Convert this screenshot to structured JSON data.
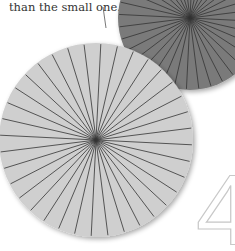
{
  "caption": "than the small one.",
  "page_number": "4",
  "colors": {
    "large_circle_fill": "#cfcfcf",
    "small_circle_fill": "#7a7a7a",
    "spoke": "#333333",
    "digit_outline": "#c8c8c8"
  },
  "large_circle": {
    "cx": 96,
    "cy": 140,
    "r": 97,
    "spokes": 36
  },
  "small_circle": {
    "cx": 190,
    "cy": 18,
    "r": 72,
    "spokes": 36
  },
  "leader_line": {
    "x1": 103,
    "y1": 7,
    "x2": 106,
    "y2": 28
  }
}
